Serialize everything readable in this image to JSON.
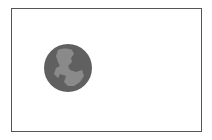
{
  "image": {
    "frame_color": "#555555",
    "background": "#ffffff",
    "icon": {
      "name": "globe-icon",
      "circle_color": "#606060",
      "land_color": "#8a8a8a"
    }
  }
}
